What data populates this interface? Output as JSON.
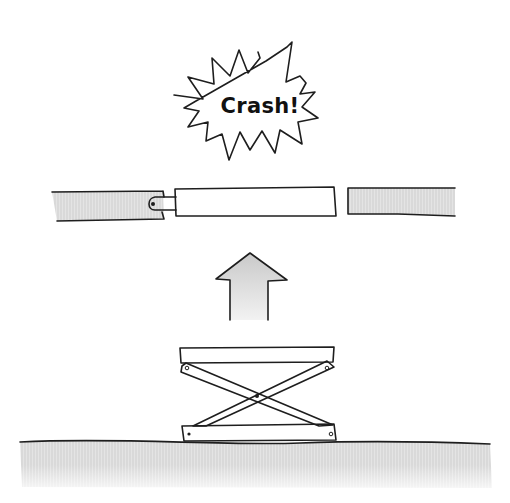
{
  "illustration": {
    "caption_bubble": {
      "text": "Crash!",
      "shape": "starburst"
    },
    "beams": {
      "left": {
        "fill": "hatched-gray"
      },
      "middle": {
        "fill": "white",
        "connected_by": "hinge"
      },
      "right": {
        "fill": "hatched-gray"
      }
    },
    "arrow": {
      "direction": "up",
      "fill": "gray-gradient"
    },
    "scissor_lift": {
      "parts": [
        "top-plate",
        "crossed-arms",
        "pivot",
        "base-plate"
      ]
    },
    "ground": {
      "fill": "hatched-gray"
    },
    "colors": {
      "ink": "#1e1e1e",
      "gray_fill": "#d6d6d6",
      "background": "#ffffff"
    }
  }
}
